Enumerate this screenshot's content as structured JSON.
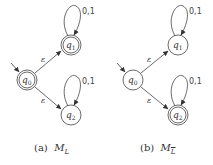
{
  "figures": [
    {
      "id": "a",
      "caption_prefix": "(a)",
      "caption_name": "M",
      "caption_sub": "L",
      "caption_sub_overline": false,
      "states": [
        {
          "name": "q",
          "sub": "0",
          "accepting": true,
          "initial": true
        },
        {
          "name": "q",
          "sub": "1",
          "accepting": true,
          "initial": false
        },
        {
          "name": "q",
          "sub": "2",
          "accepting": false,
          "initial": false
        }
      ],
      "transitions": [
        {
          "from": "q0",
          "to": "q1",
          "label": "ε"
        },
        {
          "from": "q0",
          "to": "q2",
          "label": "ε"
        },
        {
          "from": "q1",
          "to": "q1",
          "label": "0,1"
        },
        {
          "from": "q2",
          "to": "q2",
          "label": "0,1"
        }
      ]
    },
    {
      "id": "b",
      "caption_prefix": "(b)",
      "caption_name": "M",
      "caption_sub": "L",
      "caption_sub_overline": true,
      "states": [
        {
          "name": "q",
          "sub": "0",
          "accepting": false,
          "initial": true
        },
        {
          "name": "q",
          "sub": "1",
          "accepting": false,
          "initial": false
        },
        {
          "name": "q",
          "sub": "2",
          "accepting": true,
          "initial": false
        }
      ],
      "transitions": [
        {
          "from": "q0",
          "to": "q1",
          "label": "ε"
        },
        {
          "from": "q0",
          "to": "q2",
          "label": "ε"
        },
        {
          "from": "q1",
          "to": "q1",
          "label": "0,1"
        },
        {
          "from": "q2",
          "to": "q2",
          "label": "0,1"
        }
      ]
    }
  ]
}
